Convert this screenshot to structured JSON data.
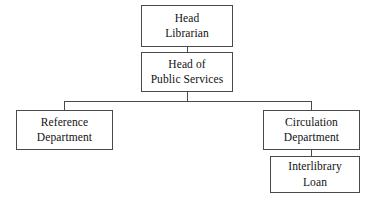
{
  "diagram": {
    "type": "organizational-chart",
    "colors": {
      "background": "#ffffff",
      "border": "#4a4a4a",
      "text": "#111111",
      "connector": "#4a4a4a"
    },
    "nodes": [
      {
        "id": "head-librarian",
        "lines": [
          "Head",
          "Librarian"
        ],
        "level": 0
      },
      {
        "id": "head-public-services",
        "lines": [
          "Head of",
          "Public Services"
        ],
        "level": 1
      },
      {
        "id": "reference-department",
        "lines": [
          "Reference",
          "Department"
        ],
        "level": 2
      },
      {
        "id": "circulation-department",
        "lines": [
          "Circulation",
          "Department"
        ],
        "level": 2
      },
      {
        "id": "interlibrary-loan",
        "lines": [
          "Interlibrary",
          "Loan"
        ],
        "level": 3
      }
    ],
    "edges": [
      {
        "from": "head-librarian",
        "to": "head-public-services"
      },
      {
        "from": "head-public-services",
        "to": "reference-department"
      },
      {
        "from": "head-public-services",
        "to": "circulation-department"
      },
      {
        "from": "circulation-department",
        "to": "interlibrary-loan"
      }
    ]
  }
}
